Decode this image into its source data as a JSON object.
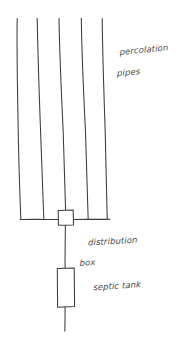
{
  "canvas": {
    "width": 189,
    "height": 347,
    "background_color": "#ffffff",
    "ink_color": "#3b3b3b",
    "style": "hand-drawn pencil sketch"
  },
  "diagram": {
    "title_visible": false
  },
  "labels": {
    "percolation_pipes": {
      "line1": "percolation",
      "line2": "pipes"
    },
    "distribution_box": {
      "line1": "distribution",
      "line2": "box"
    },
    "septic_tank": {
      "line1": "septic tank"
    }
  },
  "components": {
    "percolation_pipes": {
      "count": 5,
      "orientation": "vertical",
      "pipes": [
        {
          "x_top": 17,
          "y_top": 18,
          "x_bottom": 21,
          "y_bottom": 219
        },
        {
          "x_top": 37,
          "y_top": 18,
          "x_bottom": 44,
          "y_bottom": 219
        },
        {
          "x_top": 59,
          "y_top": 18,
          "x_bottom": 66,
          "y_bottom": 219
        },
        {
          "x_top": 81,
          "y_top": 18,
          "x_bottom": 88,
          "y_bottom": 219
        },
        {
          "x_top": 102,
          "y_top": 18,
          "x_bottom": 107,
          "y_bottom": 219
        }
      ]
    },
    "manifold": {
      "y": 219,
      "x_start": 20,
      "x_end": 110
    },
    "distribution_box": {
      "x": 58,
      "y": 210,
      "width": 15,
      "height": 15,
      "shape": "square"
    },
    "connector_pipe": {
      "x": 65,
      "y_start": 225,
      "y_end": 268
    },
    "septic_tank": {
      "x": 57,
      "y": 268,
      "width": 17,
      "height": 39,
      "shape": "rectangle"
    },
    "outlet_pipe": {
      "x": 65,
      "y_start": 307,
      "y_end": 331
    }
  }
}
